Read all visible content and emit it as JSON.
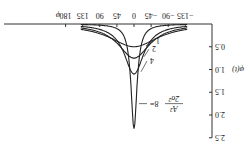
{
  "chart_data": {
    "type": "line",
    "orientation_note": "figure rendered rotated 180 degrees",
    "title": "",
    "xlabel": "φ",
    "ylabel": "φ(t)",
    "x_ticks": [
      "-135",
      "-90",
      "-45",
      "0",
      "45",
      "90",
      "135",
      "180"
    ],
    "y_ticks": [
      "0.5",
      "1.0",
      "1.5",
      "2.0",
      "2.5"
    ],
    "xlim": [
      -135,
      200
    ],
    "ylim": [
      0,
      2.5
    ],
    "parameter_label": "A²/2σ²",
    "series": [
      {
        "name": "1",
        "peak": 0.5,
        "width": 60
      },
      {
        "name": "2",
        "peak": 0.75,
        "width": 48
      },
      {
        "name": "4",
        "peak": 1.1,
        "width": 36
      },
      {
        "name": "8",
        "peak": 2.3,
        "width": 16
      }
    ],
    "curve_labels": [
      "1",
      "2",
      "4",
      "8="
    ]
  },
  "axes": {
    "x_axis_label": "φ",
    "y_axis_label": "φ(t)",
    "param_numerator": "A²",
    "param_denominator": "2σ²"
  }
}
